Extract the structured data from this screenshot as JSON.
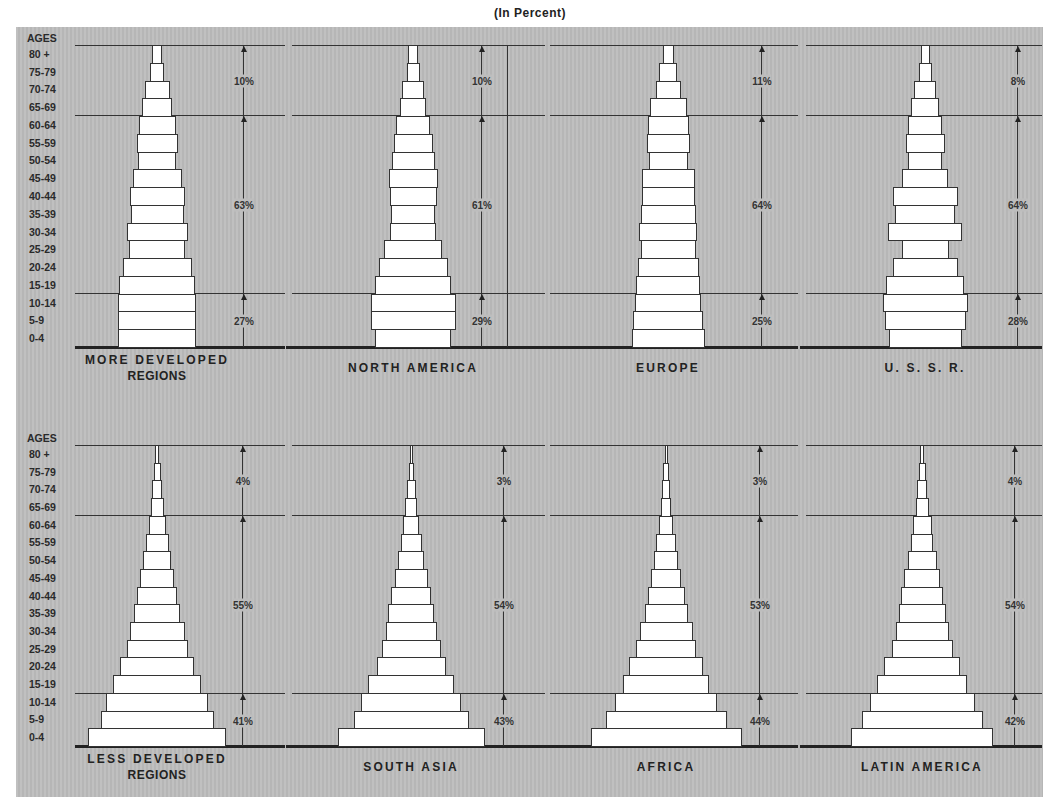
{
  "header": {
    "title": "(In Percent)"
  },
  "axis": {
    "label": "AGES",
    "groups": [
      "80 +",
      "75-79",
      "70-74",
      "65-69",
      "60-64",
      "55-59",
      "50-54",
      "45-49",
      "40-44",
      "35-39",
      "30-34",
      "25-29",
      "20-24",
      "15-19",
      "10-14",
      "5-9",
      "0-4"
    ]
  },
  "chart_data": {
    "type": "bar",
    "title": "(In Percent)",
    "subtype": "population-pyramid",
    "ylabel": "AGES",
    "categories": [
      "80 +",
      "75-79",
      "70-74",
      "65-69",
      "60-64",
      "55-59",
      "50-54",
      "45-49",
      "40-44",
      "35-39",
      "30-34",
      "25-29",
      "20-24",
      "15-19",
      "10-14",
      "5-9",
      "0-4"
    ],
    "series": [
      {
        "name": "MORE DEVELOPED REGIONS",
        "row": 0,
        "values": [
          10,
          14,
          25,
          30,
          37,
          41,
          38,
          49,
          55,
          53,
          61,
          56,
          69,
          76,
          78,
          78,
          78
        ],
        "bands": {
          "65+": "10%",
          "15-64": "63%",
          "0-14": "27%"
        }
      },
      {
        "name": "NORTH AMERICA",
        "row": 0,
        "values": [
          10,
          13,
          22,
          26,
          34,
          39,
          43,
          49,
          47,
          44,
          46,
          58,
          69,
          76,
          85,
          85,
          76
        ],
        "bands": {
          "65+": "10%",
          "15-64": "61%",
          "0-14": "29%"
        }
      },
      {
        "name": "EUROPE",
        "row": 0,
        "values": [
          11,
          18,
          25,
          37,
          41,
          43,
          39,
          53,
          53,
          55,
          58,
          55,
          61,
          64,
          66,
          70,
          73
        ],
        "bands": {
          "65+": "11%",
          "15-64": "64%",
          "0-14": "25%"
        }
      },
      {
        "name": "U.S.S.R.",
        "row": 0,
        "values": [
          9,
          13,
          22,
          28,
          34,
          39,
          34,
          46,
          65,
          60,
          74,
          47,
          65,
          78,
          85,
          81,
          73
        ],
        "bands": {
          "65+": "8%",
          "15-64": "64%",
          "0-14": "28%"
        }
      },
      {
        "name": "LESS DEVELOPED REGIONS",
        "row": 1,
        "values": [
          4,
          7,
          10,
          13,
          17,
          23,
          28,
          34,
          40,
          46,
          55,
          61,
          74,
          88,
          102,
          113,
          138
        ],
        "bands": {
          "65+": "4%",
          "15-64": "55%",
          "0-14": "41%"
        }
      },
      {
        "name": "SOUTH ASIA",
        "row": 1,
        "values": [
          3,
          5,
          9,
          12,
          16,
          21,
          26,
          33,
          40,
          46,
          51,
          59,
          69,
          86,
          100,
          115,
          147
        ],
        "bands": {
          "65+": "3%",
          "15-64": "54%",
          "0-14": "43%"
        }
      },
      {
        "name": "AFRICA",
        "row": 1,
        "values": [
          3,
          6,
          8,
          10,
          14,
          20,
          24,
          30,
          37,
          43,
          53,
          60,
          74,
          86,
          102,
          121,
          151
        ],
        "bands": {
          "65+": "3%",
          "15-64": "53%",
          "0-14": "44%"
        }
      },
      {
        "name": "LATIN AMERICA",
        "row": 1,
        "values": [
          4,
          7,
          10,
          13,
          19,
          22,
          29,
          36,
          42,
          47,
          53,
          61,
          76,
          90,
          105,
          121,
          142
        ],
        "bands": {
          "65+": "4%",
          "15-64": "54%",
          "0-14": "42%"
        }
      }
    ]
  },
  "panels": [
    {
      "label_line1": "MORE DEVELOPED",
      "label_line2": "REGIONS",
      "pct_old": "10%",
      "pct_mid": "63%",
      "pct_young": "27%"
    },
    {
      "label_line1": "NORTH AMERICA",
      "label_line2": "",
      "pct_old": "10%",
      "pct_mid": "61%",
      "pct_young": "29%"
    },
    {
      "label_line1": "EUROPE",
      "label_line2": "",
      "pct_old": "11%",
      "pct_mid": "64%",
      "pct_young": "25%"
    },
    {
      "label_line1": "U. S. S. R.",
      "label_line2": "",
      "pct_old": "8%",
      "pct_mid": "64%",
      "pct_young": "28%"
    },
    {
      "label_line1": "LESS DEVELOPED",
      "label_line2": "REGIONS",
      "pct_old": "4%",
      "pct_mid": "55%",
      "pct_young": "41%"
    },
    {
      "label_line1": "SOUTH ASIA",
      "label_line2": "",
      "pct_old": "3%",
      "pct_mid": "54%",
      "pct_young": "43%"
    },
    {
      "label_line1": "AFRICA",
      "label_line2": "",
      "pct_old": "3%",
      "pct_mid": "53%",
      "pct_young": "44%"
    },
    {
      "label_line1": "LATIN AMERICA",
      "label_line2": "",
      "pct_old": "4%",
      "pct_mid": "54%",
      "pct_young": "42%"
    }
  ]
}
